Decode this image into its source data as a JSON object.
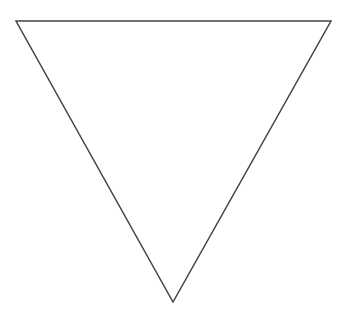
{
  "canvas": {
    "width": 347,
    "height": 319,
    "background": "#ffffff"
  },
  "shape": {
    "type": "inverted-triangle",
    "points": [
      [
        16,
        21
      ],
      [
        331,
        21
      ],
      [
        173,
        302
      ]
    ],
    "stroke": "#444444",
    "stroke_width": 1.5,
    "fill": "none"
  }
}
